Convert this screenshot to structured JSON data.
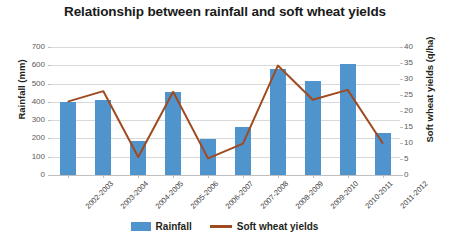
{
  "chart_data": {
    "type": "bar",
    "title": "Relationship between rainfall and soft wheat yields",
    "xlabel": "",
    "categories": [
      "2002-2003",
      "2003-2004",
      "2004-2005",
      "2005-2006",
      "2006-2007",
      "2007-2008",
      "2008-2009",
      "2009-2010",
      "2010-2011",
      "2011-2012"
    ],
    "grid": true,
    "legend_position": "bottom",
    "axes": {
      "left": {
        "label": "Rainfall (mm)",
        "ylim": [
          0,
          700
        ],
        "tick_step": 100,
        "ticks": [
          "700",
          "600",
          "500",
          "400",
          "300",
          "200",
          "100",
          "0"
        ],
        "tick_values": [
          700,
          600,
          500,
          400,
          300,
          200,
          100,
          0
        ]
      },
      "right": {
        "label": "Soft wheat yields (q/ha)",
        "ylim": [
          0,
          40
        ],
        "tick_step": 5,
        "ticks": [
          "40",
          "35",
          "30",
          "25",
          "20",
          "15",
          "10",
          "5",
          "0"
        ],
        "tick_values": [
          40,
          35,
          30,
          25,
          20,
          15,
          10,
          5,
          0
        ]
      }
    },
    "series": [
      {
        "name": "Rainfall",
        "type": "bar",
        "axis": "left",
        "unit": "mm",
        "color": "#4f94cd",
        "values": [
          398,
          412,
          185,
          452,
          196,
          262,
          580,
          516,
          605,
          230
        ]
      },
      {
        "name": "Soft wheat yields",
        "type": "line",
        "axis": "right",
        "unit": "q/ha",
        "color": "#a04a20",
        "values": [
          23.0,
          26.2,
          5.6,
          26.0,
          5.2,
          9.8,
          34.2,
          23.5,
          26.6,
          10.0
        ]
      }
    ]
  },
  "legend": {
    "entries": [
      {
        "label": "Rainfall",
        "marker": "bar-swatch",
        "color": "#4f94cd"
      },
      {
        "label": "Soft wheat yields",
        "marker": "line-swatch",
        "color": "#a04a20"
      }
    ]
  }
}
